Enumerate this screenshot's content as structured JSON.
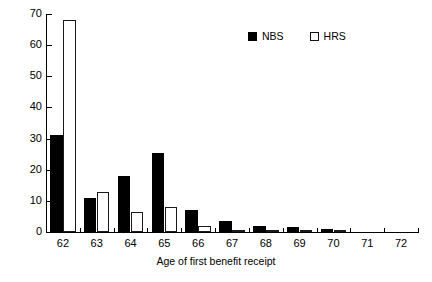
{
  "chart_data": {
    "type": "bar",
    "title": "",
    "xlabel": "Age of first benefit receipt",
    "ylabel": "",
    "categories": [
      "62",
      "63",
      "64",
      "65",
      "66",
      "67",
      "68",
      "69",
      "70",
      "71",
      "72"
    ],
    "series": [
      {
        "name": "NBS",
        "color": "#000000",
        "style": "filled",
        "values": [
          31,
          11,
          18,
          25.5,
          7,
          3.5,
          2,
          1.5,
          1,
          0,
          0
        ]
      },
      {
        "name": "HRS",
        "color": "#ffffff",
        "style": "hollow",
        "values": [
          68,
          13,
          6.5,
          8,
          2,
          0.6,
          0.5,
          0.3,
          0.3,
          0,
          0
        ]
      }
    ],
    "ylim": [
      0,
      70
    ],
    "yticks": [
      0,
      10,
      20,
      30,
      40,
      50,
      60,
      70
    ],
    "ytick_labels": [
      "0",
      "10",
      "20",
      "30",
      "40",
      "50",
      "60",
      "70"
    ],
    "xtick_labels": [
      "62",
      "63",
      "64",
      "65",
      "66",
      "67",
      "68",
      "69",
      "70",
      "71",
      "72"
    ],
    "grid": false,
    "legend_position": "top-right",
    "legend_entries": [
      {
        "label": "NBS",
        "style": "filled"
      },
      {
        "label": "HRS",
        "style": "hollow"
      }
    ]
  },
  "axis": {
    "x_title": "Age of first benefit receipt"
  },
  "legend": {
    "nbs_label": "NBS",
    "hrs_label": "HRS"
  }
}
